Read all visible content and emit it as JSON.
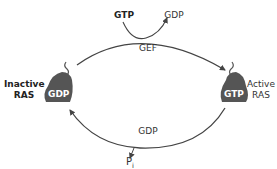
{
  "diagram": {
    "type": "cycle",
    "title": "",
    "nodes": {
      "inactive": {
        "label_line1": "Inactive",
        "label_line2": "RAS",
        "bound": "GDP"
      },
      "active": {
        "label_line1": "Active",
        "label_line2": "RAS",
        "bound": "GTP"
      }
    },
    "top_arrow": {
      "enzyme": "GEF",
      "input": "GTP",
      "output": "GDP"
    },
    "bottom_arrow": {
      "label": "GDP",
      "release": "P",
      "release_sub": "i"
    },
    "colors": {
      "protein": "#555555",
      "arrow": "#444444",
      "text": "#333333"
    }
  }
}
